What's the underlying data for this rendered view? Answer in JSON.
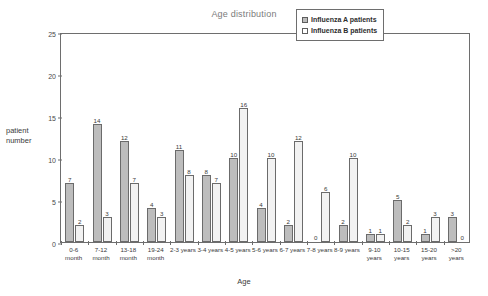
{
  "chart_data": {
    "type": "bar",
    "title": "Age distribution",
    "xlabel": "Age",
    "ylabel": "patient number",
    "ylim": [
      0,
      25
    ],
    "yticks": [
      0,
      5,
      10,
      15,
      20,
      25
    ],
    "grid": false,
    "legend_position": "top-right",
    "categories": [
      "0-6\nmonth",
      "7-12\nmonth",
      "13-18\nmonth",
      "19-24\nmonth",
      "2-3 years",
      "3-4 years",
      "4-5 years",
      "5-6 years",
      "6-7 years",
      "7-8 years",
      "8-9 years",
      "9-10\nyears",
      "10-15\nyears",
      "15-20\nyears",
      ">20\nyears"
    ],
    "series": [
      {
        "name": "Influenza A patients",
        "color": "#bdbdbd",
        "values": [
          7,
          14,
          12,
          4,
          11,
          8,
          10,
          4,
          2,
          0,
          2,
          1,
          5,
          1,
          3
        ]
      },
      {
        "name": "Influenza B patients",
        "color": "#ffffff",
        "values": [
          2,
          3,
          7,
          3,
          8,
          7,
          16,
          10,
          12,
          6,
          10,
          1,
          2,
          3,
          0
        ]
      }
    ]
  },
  "legend": {
    "entries": [
      {
        "label": "Influenza A patients"
      },
      {
        "label": "Influenza B patients"
      }
    ]
  }
}
